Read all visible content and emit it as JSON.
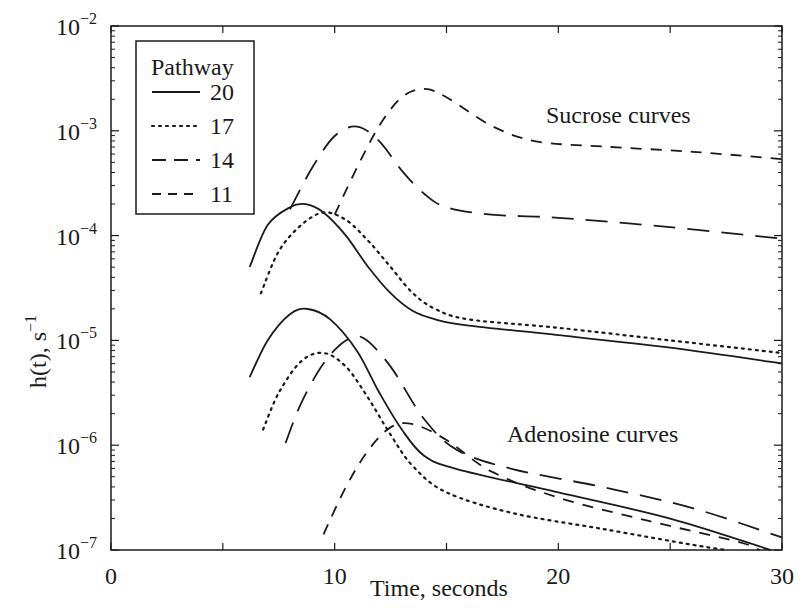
{
  "chart_data": {
    "type": "line",
    "title": "",
    "xlabel": "Time, seconds",
    "ylabel": "h(t), s^-1",
    "xlim": [
      0,
      30
    ],
    "ylim": [
      1e-07,
      0.01
    ],
    "yscale": "log",
    "grid": false,
    "x_ticks": [
      0,
      10,
      20,
      30
    ],
    "x_tick_labels": [
      "0",
      "10",
      "20",
      "30"
    ],
    "y_ticks": [
      -7,
      -6,
      -5,
      -4,
      -3,
      -2
    ],
    "y_tick_labels": [
      "10^-7",
      "10^-6",
      "10^-5",
      "10^-4",
      "10^-3",
      "10^-2"
    ],
    "legend": {
      "title": "Pathway",
      "position": "upper left",
      "entries": [
        {
          "label": "20",
          "style": "solid"
        },
        {
          "label": "17",
          "style": "dotted"
        },
        {
          "label": "14",
          "style": "long-dash"
        },
        {
          "label": "11",
          "style": "short-dash"
        }
      ]
    },
    "annotations": [
      {
        "text": "Sucrose curves",
        "x": 19.5,
        "y_log10": -2.85
      },
      {
        "text": "Adenosine curves",
        "x": 17.7,
        "y_log10": -5.9
      }
    ],
    "series": [
      {
        "name": "Sucrose pathway 20",
        "group": "Sucrose",
        "pathway": "20",
        "style": "solid",
        "t": [
          6.2,
          7,
          8,
          8.7,
          9.5,
          10.5,
          11.5,
          12.5,
          13.5,
          14.5,
          16,
          20,
          25,
          30
        ],
        "log10_h": [
          -4.3,
          -3.9,
          -3.73,
          -3.7,
          -3.78,
          -4.0,
          -4.3,
          -4.55,
          -4.72,
          -4.8,
          -4.86,
          -4.95,
          -5.07,
          -5.22
        ]
      },
      {
        "name": "Sucrose pathway 17",
        "group": "Sucrose",
        "pathway": "17",
        "style": "dotted",
        "t": [
          6.7,
          7.5,
          8.5,
          9.5,
          10.5,
          11.5,
          12.5,
          13.5,
          14.5,
          16,
          20,
          25,
          30
        ],
        "log10_h": [
          -4.55,
          -4.15,
          -3.9,
          -3.78,
          -3.85,
          -4.05,
          -4.3,
          -4.55,
          -4.7,
          -4.8,
          -4.88,
          -5.0,
          -5.12
        ]
      },
      {
        "name": "Sucrose pathway 14",
        "group": "Sucrose",
        "pathway": "14",
        "style": "long-dash",
        "t": [
          8,
          9,
          10,
          11,
          12,
          13,
          14,
          15,
          17,
          20,
          25,
          30
        ],
        "log10_h": [
          -3.75,
          -3.35,
          -3.05,
          -2.96,
          -3.1,
          -3.38,
          -3.6,
          -3.73,
          -3.8,
          -3.83,
          -3.92,
          -4.03
        ]
      },
      {
        "name": "Sucrose pathway 11",
        "group": "Sucrose",
        "pathway": "11",
        "style": "short-dash",
        "t": [
          10,
          11,
          12,
          13,
          14,
          15,
          17,
          19,
          22,
          26,
          30
        ],
        "log10_h": [
          -3.8,
          -3.35,
          -2.95,
          -2.68,
          -2.6,
          -2.68,
          -2.95,
          -3.1,
          -3.15,
          -3.2,
          -3.27
        ]
      },
      {
        "name": "Adenosine pathway 20",
        "group": "Adenosine",
        "pathway": "20",
        "style": "solid",
        "t": [
          6.2,
          7,
          8,
          8.8,
          9.8,
          11,
          12,
          13,
          14,
          15.5,
          20,
          25,
          29.5
        ],
        "log10_h": [
          -5.35,
          -5.0,
          -4.75,
          -4.7,
          -4.8,
          -5.1,
          -5.5,
          -5.85,
          -6.1,
          -6.23,
          -6.45,
          -6.7,
          -7.0
        ]
      },
      {
        "name": "Adenosine pathway 17",
        "group": "Adenosine",
        "pathway": "17",
        "style": "dotted",
        "t": [
          6.8,
          7.5,
          8.5,
          9.5,
          10.5,
          11.5,
          12.5,
          13.5,
          15,
          18,
          22,
          26,
          27.5
        ],
        "log10_h": [
          -5.85,
          -5.5,
          -5.2,
          -5.12,
          -5.25,
          -5.55,
          -5.9,
          -6.2,
          -6.45,
          -6.65,
          -6.8,
          -6.95,
          -7.0
        ]
      },
      {
        "name": "Adenosine pathway 14",
        "group": "Adenosine",
        "pathway": "14",
        "style": "long-dash",
        "t": [
          7.8,
          8.5,
          9.5,
          10.5,
          11.3,
          12.5,
          14,
          15.5,
          18,
          22,
          26,
          30
        ],
        "log10_h": [
          -5.98,
          -5.6,
          -5.22,
          -5.0,
          -4.98,
          -5.25,
          -5.75,
          -6.05,
          -6.23,
          -6.4,
          -6.6,
          -6.88
        ]
      },
      {
        "name": "Adenosine pathway 11",
        "group": "Adenosine",
        "pathway": "11",
        "style": "short-dash",
        "t": [
          9.5,
          10.5,
          11.5,
          12.5,
          13.5,
          15,
          17,
          20,
          24,
          28,
          29
        ],
        "log10_h": [
          -6.85,
          -6.4,
          -6.05,
          -5.83,
          -5.8,
          -5.95,
          -6.25,
          -6.5,
          -6.72,
          -6.92,
          -7.0
        ]
      }
    ]
  },
  "plot": {
    "x_axis_label": "Time, seconds",
    "y_axis_label_main": "h(t), s",
    "y_axis_label_exp": "−1",
    "legend_title": "Pathway",
    "annotation_sucrose": "Sucrose curves",
    "annotation_adenosine": "Adenosine curves",
    "line_color": "#1a1a1a"
  }
}
